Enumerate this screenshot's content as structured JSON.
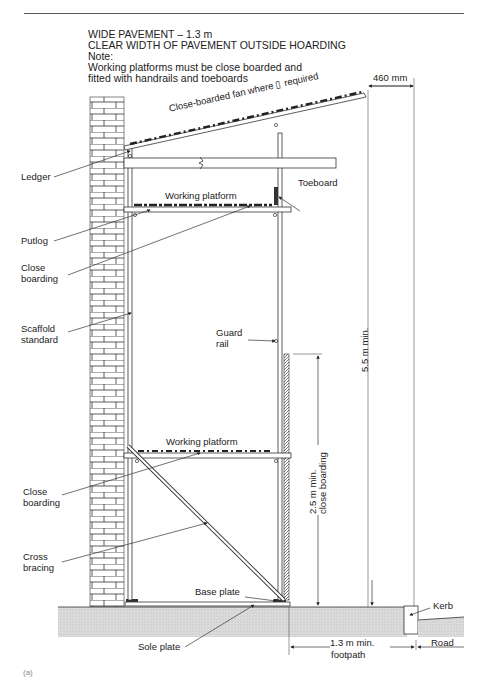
{
  "header": {
    "title_line1": "WIDE PAVEMENT  – 1.3 m",
    "title_line2": "CLEAR WIDTH OF PAVEMENT OUTSIDE HOARDING",
    "note_label": "Note:",
    "note_line1": "Working platforms must be close boarded and",
    "note_line2": "fitted with handrails and toeboards"
  },
  "dimensions": {
    "fan_overhang": "460 mm",
    "min_height": "5.5 m min.",
    "boarding_height_line1": "2.5 m min.",
    "boarding_height_line2": "close boarding",
    "footpath_line1": "1.3 m min.",
    "footpath_line2": "footpath"
  },
  "labels": {
    "fan": "Close-boarded fan where ▯ required",
    "ledger": "Ledger",
    "toeboard": "Toeboard",
    "working_platform_upper": "Working platform",
    "working_platform_lower": "Working platform",
    "putlog": "Putlog",
    "close_boarding_upper_1": "Close",
    "close_boarding_upper_2": "boarding",
    "scaffold_standard_1": "Scaffold",
    "scaffold_standard_2": "standard",
    "guard_rail_1": "Guard",
    "guard_rail_2": "rail",
    "close_boarding_lower_1": "Close",
    "close_boarding_lower_2": "boarding",
    "cross_bracing_1": "Cross",
    "cross_bracing_2": "bracing",
    "base_plate": "Base plate",
    "sole_plate": "Sole plate",
    "kerb": "Kerb",
    "road": "Road"
  },
  "figure_tag": "(a)",
  "colors": {
    "line": "#333333",
    "ground_fill": "#d8d8d8",
    "board_dark": "#222222"
  }
}
